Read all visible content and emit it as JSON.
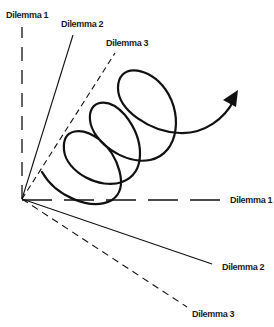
{
  "diagram": {
    "type": "spiral-dilemma-axes",
    "origin": [
      22,
      199
    ],
    "stroke_color": "#111111",
    "labels": {
      "d1_top": "Dilemma 1",
      "d2_top": "Dilemma 2",
      "d3_top": "Dilemma 3",
      "d1_right": "Dilemma 1",
      "d2_right": "Dilemma 2",
      "d3_right": "Dilemma 3"
    },
    "axes": [
      {
        "id": "d1-vertical",
        "style": "long-dash",
        "to": [
          22,
          27
        ]
      },
      {
        "id": "d2-upper",
        "style": "solid",
        "to": [
          73,
          35
        ]
      },
      {
        "id": "d3-upper",
        "style": "dash",
        "to": [
          115,
          53
        ]
      },
      {
        "id": "d1-horizontal",
        "style": "long-dash",
        "to": [
          222,
          200
        ]
      },
      {
        "id": "d2-lower",
        "style": "solid",
        "to": [
          212,
          264
        ]
      },
      {
        "id": "d3-lower",
        "style": "dash",
        "to": [
          187,
          307
        ]
      }
    ],
    "spiral": {
      "loops": 3,
      "direction": "upward-right",
      "arrowhead": true
    }
  }
}
